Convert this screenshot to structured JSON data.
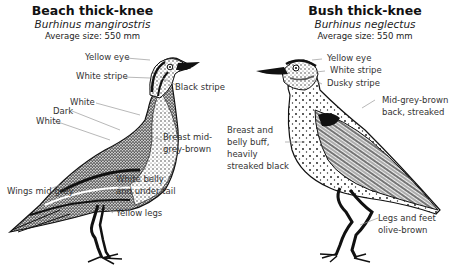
{
  "species": [
    {
      "common_name": "Beach thick-knee",
      "scientific_name": "Burhinus mangirostris",
      "average_size": "Average size: 550 mm",
      "labels": {
        "yellow_eye": "Yellow eye",
        "white_stripe": "White stripe",
        "black_stripe": "Black stripe",
        "white_upper": "White",
        "dark": "Dark",
        "white_lower": "White",
        "breast_1": "Breast mid-",
        "breast_2": "grey-brown",
        "belly_1": "White belly",
        "belly_2": "and under tail",
        "wings": "Wings mid-grey",
        "legs": "Yellow legs"
      }
    },
    {
      "common_name": "Bush thick-knee",
      "scientific_name": "Burhinus neglectus",
      "average_size": "Average size: 550 mm",
      "labels": {
        "yellow_eye": "Yellow eye",
        "white_stripe": "White stripe",
        "dusky_stripe": "Dusky stripe",
        "back_1": "Mid-grey-brown",
        "back_2": "back, streaked",
        "breast_1": "Breast and",
        "breast_2": "belly buff,",
        "breast_3": "heavily",
        "breast_4": "streaked black",
        "legs_1": "Legs and feet",
        "legs_2": "olive-brown"
      }
    }
  ],
  "colors": {
    "ink": "#111111",
    "label": "#333333",
    "leader": "#999999",
    "background": "#ffffff"
  }
}
